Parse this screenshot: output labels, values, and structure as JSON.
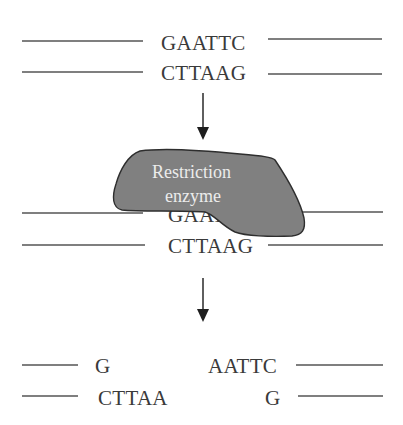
{
  "diagram": {
    "colors": {
      "background": "#ffffff",
      "strand": "#555555",
      "sequence_text": "#3a3a3a",
      "arrow": "#1e1e1e",
      "enzyme_fill": "#808080",
      "enzyme_outline": "#2e2e2e",
      "enzyme_text": "#ececec"
    },
    "stage1": {
      "top_strand": "GAATTC",
      "bottom_strand": "CTTAAG"
    },
    "stage2": {
      "top_strand_visible": "GAAT",
      "bottom_strand": "CTTAAG",
      "enzyme": {
        "label_line1": "Restriction",
        "label_line2": "enzyme"
      }
    },
    "stage3": {
      "left_fragment": {
        "top_strand": "G",
        "bottom_strand": "CTTAA"
      },
      "right_fragment": {
        "top_strand": "AATTC",
        "bottom_strand": "G"
      }
    },
    "arrows": [
      {
        "name": "arrow-stage1-to-stage2",
        "icon": "down-arrow"
      },
      {
        "name": "arrow-stage2-to-stage3",
        "icon": "down-arrow"
      }
    ]
  }
}
